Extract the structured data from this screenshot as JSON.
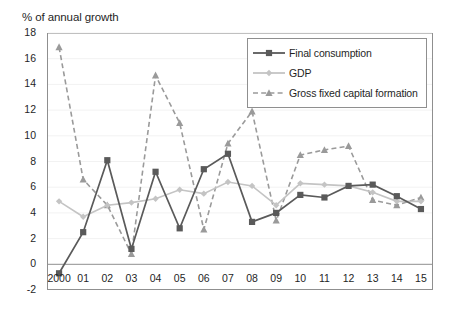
{
  "chart_data": {
    "type": "line",
    "title": "% of annual growth",
    "xlabel": "",
    "ylabel": "",
    "ylim": [
      -2,
      18
    ],
    "ytick_step": 2,
    "yticks": [
      "18",
      "16",
      "14",
      "12",
      "10",
      "8",
      "6",
      "4",
      "2",
      "0",
      "-2"
    ],
    "grid": false,
    "legend_position": "top-right",
    "categories": [
      "2000",
      "01",
      "02",
      "03",
      "04",
      "05",
      "06",
      "07",
      "08",
      "09",
      "10",
      "11",
      "12",
      "13",
      "14",
      "15"
    ],
    "series": [
      {
        "name": "Final consumption",
        "color": "#5a5a5a",
        "marker": "square",
        "linestyle": "solid",
        "values": [
          -0.7,
          2.5,
          8.1,
          1.2,
          7.2,
          2.8,
          7.4,
          8.6,
          3.3,
          4.0,
          5.4,
          5.2,
          6.1,
          6.2,
          5.3,
          4.3
        ]
      },
      {
        "name": "GDP",
        "color": "#c4c4c4",
        "marker": "diamond",
        "linestyle": "solid",
        "values": [
          4.9,
          3.7,
          4.6,
          4.8,
          5.1,
          5.8,
          5.5,
          6.4,
          6.1,
          4.6,
          6.3,
          6.2,
          6.1,
          5.6,
          4.9,
          4.9
        ]
      },
      {
        "name": "Gross fixed capital formation",
        "color": "#9a9a9a",
        "marker": "triangle",
        "linestyle": "dashed",
        "values": [
          16.9,
          6.6,
          4.6,
          0.8,
          14.7,
          11.0,
          2.7,
          9.4,
          11.9,
          3.4,
          8.5,
          8.9,
          9.2,
          5.0,
          4.6,
          5.2
        ]
      }
    ]
  },
  "legend": {
    "items": [
      {
        "label": "Final consumption"
      },
      {
        "label": "GDP"
      },
      {
        "label": "Gross fixed capital formation"
      }
    ]
  }
}
